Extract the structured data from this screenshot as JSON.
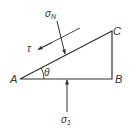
{
  "diagram": {
    "vertices": {
      "A": "A",
      "B": "B",
      "C": "C"
    },
    "angle_label": "θ",
    "normal_stress": {
      "symbol": "σ",
      "subscript": "N"
    },
    "shear_stress": {
      "symbol": "τ"
    },
    "principal_stress": {
      "symbol": "σ",
      "subscript": "1"
    },
    "colors": {
      "stroke": "#333333",
      "background": "#ffffff"
    }
  }
}
